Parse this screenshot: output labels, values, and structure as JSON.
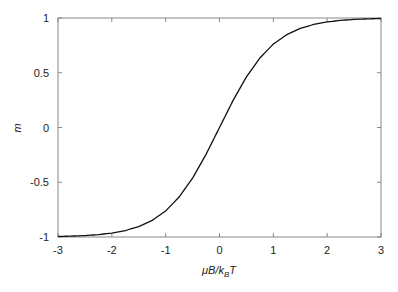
{
  "chart_data": {
    "type": "line",
    "title": "",
    "xlabel": "μB/k_BT",
    "ylabel": "m",
    "xlim": [
      -3,
      3
    ],
    "ylim": [
      -1,
      1
    ],
    "xticks": [
      "-3",
      "-2",
      "-1",
      "0",
      "1",
      "2",
      "3"
    ],
    "yticks": [
      "1",
      "0.5",
      "0",
      "-0.5",
      "-1"
    ],
    "grid": false,
    "legend": null,
    "series": [
      {
        "name": "m = tanh(μB/k_BT)",
        "color": "#111111",
        "x": [
          -3,
          -2.75,
          -2.5,
          -2.25,
          -2,
          -1.75,
          -1.5,
          -1.25,
          -1,
          -0.75,
          -0.5,
          -0.25,
          0,
          0.25,
          0.5,
          0.75,
          1,
          1.25,
          1.5,
          1.75,
          2,
          2.25,
          2.5,
          2.75,
          3
        ],
        "y": [
          -0.995,
          -0.992,
          -0.987,
          -0.978,
          -0.964,
          -0.941,
          -0.905,
          -0.848,
          -0.762,
          -0.635,
          -0.462,
          -0.245,
          0,
          0.245,
          0.462,
          0.635,
          0.762,
          0.848,
          0.905,
          0.941,
          0.964,
          0.978,
          0.987,
          0.992,
          0.995
        ]
      }
    ]
  },
  "labels": {
    "x_main": "μB/k",
    "x_sub": "B",
    "x_tail": "T",
    "y": "m"
  }
}
